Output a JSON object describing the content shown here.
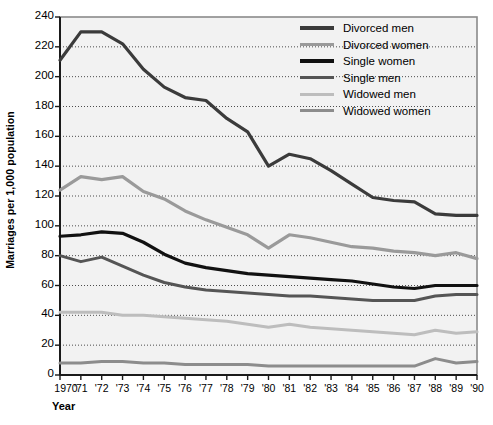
{
  "chart_data": {
    "type": "line",
    "title": "",
    "xlabel": "Year",
    "ylabel": "Marriages per 1,000 population",
    "xlim": [
      1970,
      1990
    ],
    "ylim": [
      0,
      240
    ],
    "ytick_step": 20,
    "grid": true,
    "legend_position": "top-right",
    "x": [
      1970,
      1971,
      1972,
      1973,
      1974,
      1975,
      1976,
      1977,
      1978,
      1979,
      1980,
      1981,
      1982,
      1983,
      1984,
      1985,
      1986,
      1987,
      1988,
      1989,
      1990
    ],
    "xtick_labels": [
      "1970",
      "'71",
      "'72",
      "'73",
      "'74",
      "'75",
      "'76",
      "'77",
      "'78",
      "'79",
      "'80",
      "'81",
      "'82",
      "'83",
      "'84",
      "'85",
      "'86",
      "'87",
      "'88",
      "'89",
      "'90"
    ],
    "ytick_labels": [
      "0",
      "20",
      "40",
      "60",
      "80",
      "100",
      "120",
      "140",
      "160",
      "180",
      "200",
      "220",
      "240"
    ],
    "series": [
      {
        "name": "Divorced men",
        "color": "#3b3b3b",
        "width": 3.2,
        "values": [
          211,
          230,
          230,
          222,
          205,
          193,
          186,
          184,
          172,
          163,
          140,
          148,
          145,
          137,
          128,
          119,
          117,
          116,
          108,
          107,
          107
        ]
      },
      {
        "name": "Divorced women",
        "color": "#9a9a9a",
        "width": 3.2,
        "values": [
          124,
          133,
          131,
          133,
          123,
          118,
          110,
          104,
          99,
          94,
          85,
          94,
          92,
          89,
          86,
          85,
          83,
          82,
          80,
          82,
          78
        ]
      },
      {
        "name": "Single women",
        "color": "#111111",
        "width": 3.2,
        "values": [
          93,
          94,
          96,
          95,
          89,
          81,
          75,
          72,
          70,
          68,
          67,
          66,
          65,
          64,
          63,
          61,
          59,
          58,
          60,
          60,
          60
        ]
      },
      {
        "name": "Single men",
        "color": "#555555",
        "width": 3.0,
        "values": [
          80,
          76,
          79,
          73,
          67,
          62,
          59,
          57,
          56,
          55,
          54,
          53,
          53,
          52,
          51,
          50,
          50,
          50,
          53,
          54,
          54
        ]
      },
      {
        "name": "Widowed men",
        "color": "#bdbdbd",
        "width": 3.0,
        "values": [
          42,
          42,
          42,
          40,
          40,
          39,
          38,
          37,
          36,
          34,
          32,
          34,
          32,
          31,
          30,
          29,
          28,
          27,
          30,
          28,
          29
        ]
      },
      {
        "name": "Widowed women",
        "color": "#8c8c8c",
        "width": 3.0,
        "values": [
          8,
          8,
          9,
          9,
          8,
          8,
          7,
          7,
          7,
          7,
          6,
          6,
          6,
          6,
          6,
          6,
          6,
          6,
          11,
          8,
          9
        ]
      }
    ]
  },
  "legend": {
    "items": [
      {
        "label": "Divorced men"
      },
      {
        "label": "Divorced women"
      },
      {
        "label": "Single women"
      },
      {
        "label": "Single men"
      },
      {
        "label": "Widowed men"
      },
      {
        "label": "Widowed women"
      }
    ]
  }
}
